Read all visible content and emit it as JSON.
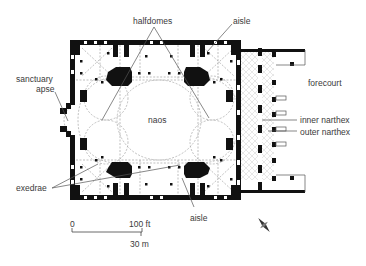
{
  "labels": {
    "halfdomes": "halfdomes",
    "aisle_top": "aisle",
    "aisle_bottom": "aisle",
    "sanctuary": "sanctuary",
    "apse": "apse",
    "naos": "naos",
    "forecourt": "forecourt",
    "inner_narthex": "inner narthex",
    "outer_narthex": "outer narthex",
    "exedrae": "exedrae"
  },
  "scale_bar": {
    "zero": "0",
    "feet": "100 ft",
    "meters": "30 m"
  },
  "colors": {
    "wall": "#111111",
    "dashed": "#9a9a9a",
    "leader": "#555555",
    "text": "#3a3a3a"
  }
}
